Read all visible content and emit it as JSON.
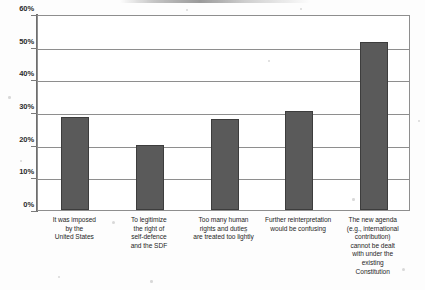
{
  "chart_data": {
    "type": "bar",
    "title": "",
    "xlabel": "",
    "ylabel": "",
    "ylim": [
      0,
      60
    ],
    "y_tick_step": 10,
    "y_tick_labels": [
      "0%",
      "10%",
      "20%",
      "30%",
      "40%",
      "50%",
      "60%"
    ],
    "y_tick_values": [
      0,
      10,
      20,
      30,
      40,
      50,
      60
    ],
    "grid": true,
    "legend": false,
    "legend_position": "none",
    "value_unit": "percent",
    "categories": [
      "It was imposed by the United States",
      "To legitimize the right of self-defence and the SDF",
      "Too many human rights and duties are treated too lightly",
      "Further reinterpretation would be confusing",
      "The new agenda (e.g., international contribution) cannot be dealt with under the existing Constitution"
    ],
    "category_lines": [
      [
        "It was imposed",
        "by the",
        "United States"
      ],
      [
        "To legitimize",
        "the right of",
        "self-defence",
        "and the SDF"
      ],
      [
        "Too many human",
        "rights and duties",
        "are treated too lightly"
      ],
      [
        "Further reinterpretation",
        "would be confusing"
      ],
      [
        "The new agenda",
        "(e.g., international",
        "contribution)",
        "cannot be dealt",
        "with under the",
        "existing",
        "Constitution"
      ]
    ],
    "values": [
      28.6,
      19.8,
      27.9,
      30.4,
      51.3
    ]
  },
  "style": {
    "bar_color": "#5a5a5a",
    "bar_border_color": "#3d3d3d",
    "axis_color": "#8e8e8e",
    "grid_color": "#8e8e8e",
    "text_color": "#1f1f1f",
    "background": "#ffffff"
  }
}
